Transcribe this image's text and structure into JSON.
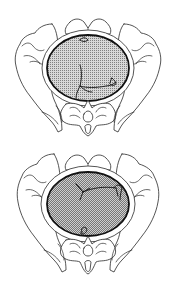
{
  "figures": [
    {
      "id": "top",
      "description": "Pelvis viewed from above with fetal head engaged in inlet",
      "head_fill": "#b8b8b8"
    },
    {
      "id": "bottom",
      "description": "Pelvis viewed from above with fetal head in alternate position",
      "head_fill": "#b8b8b8"
    }
  ],
  "colors": {
    "line": "#2a2a2a",
    "head_outline": "#111111",
    "stipple_bg": "#d6d6d6",
    "stipple_dot": "#7a7a7a",
    "background": "#ffffff"
  }
}
